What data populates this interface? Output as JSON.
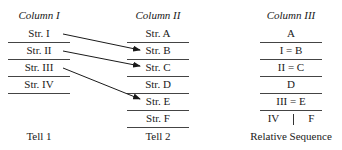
{
  "column1": {
    "title": "Column I",
    "rows": [
      "Str. I",
      "Str. II",
      "Str. III",
      "Str. IV"
    ],
    "footer": "Tell 1"
  },
  "column2": {
    "title": "Column II",
    "rows": [
      "Str. A",
      "Str. B",
      "Str. C",
      "Str. D",
      "Str. E",
      "Str. F"
    ],
    "footer": "Tell 2"
  },
  "column3": {
    "title": "Column III",
    "rows": [
      "A",
      "I = B",
      "II = C",
      "D",
      "III = E"
    ],
    "last_row": {
      "left": "IV",
      "right": "F"
    },
    "footer": "Relative Sequence"
  },
  "connections": [
    {
      "from": "Str. I",
      "to": "Str. B"
    },
    {
      "from": "Str. II",
      "to": "Str. C"
    },
    {
      "from": "Str. III",
      "to": "Str. E"
    }
  ]
}
